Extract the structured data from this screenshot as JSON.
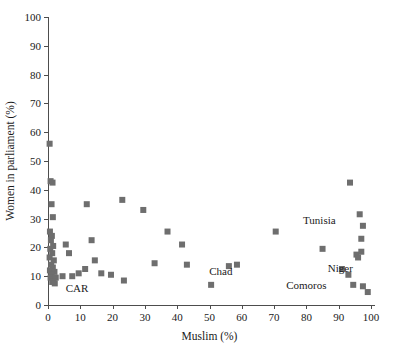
{
  "chart_data": {
    "type": "scatter",
    "title": "",
    "xlabel": "Muslim (%)",
    "ylabel": "Women in parliament (%)",
    "xlim": [
      0,
      100
    ],
    "ylim": [
      0,
      100
    ],
    "xticks": [
      0,
      10,
      20,
      30,
      40,
      50,
      60,
      70,
      80,
      90,
      100
    ],
    "yticks": [
      0,
      10,
      20,
      30,
      40,
      50,
      60,
      70,
      80,
      90,
      100
    ],
    "grid": false,
    "legend": "none",
    "marker": {
      "shape": "square",
      "color": "#6e6e6e",
      "size": 6
    },
    "points": [
      {
        "x": 0.5,
        "y": 56.0
      },
      {
        "x": 0.8,
        "y": 43.0
      },
      {
        "x": 1.4,
        "y": 42.5
      },
      {
        "x": 1.1,
        "y": 35.0
      },
      {
        "x": 1.5,
        "y": 30.5
      },
      {
        "x": 0.6,
        "y": 25.5
      },
      {
        "x": 1.2,
        "y": 24.0
      },
      {
        "x": 0.9,
        "y": 22.5
      },
      {
        "x": 1.6,
        "y": 20.5
      },
      {
        "x": 0.7,
        "y": 19.5
      },
      {
        "x": 1.3,
        "y": 18.0
      },
      {
        "x": 0.5,
        "y": 16.5
      },
      {
        "x": 1.8,
        "y": 15.5
      },
      {
        "x": 1.0,
        "y": 14.0
      },
      {
        "x": 1.5,
        "y": 13.0
      },
      {
        "x": 0.6,
        "y": 12.0
      },
      {
        "x": 2.0,
        "y": 11.5
      },
      {
        "x": 1.1,
        "y": 10.5
      },
      {
        "x": 0.8,
        "y": 9.5
      },
      {
        "x": 1.7,
        "y": 9.0
      },
      {
        "x": 2.4,
        "y": 9.5
      },
      {
        "x": 1.3,
        "y": 8.0
      },
      {
        "x": 2.1,
        "y": 7.5
      },
      {
        "x": 4.5,
        "y": 10.0
      },
      {
        "x": 7.5,
        "y": 10.0
      },
      {
        "x": 6.5,
        "y": 18.0
      },
      {
        "x": 5.5,
        "y": 21.0
      },
      {
        "x": 9.5,
        "y": 11.0
      },
      {
        "x": 12.0,
        "y": 35.0
      },
      {
        "x": 11.5,
        "y": 12.5
      },
      {
        "x": 13.5,
        "y": 22.5
      },
      {
        "x": 14.5,
        "y": 15.5
      },
      {
        "x": 16.5,
        "y": 11.0
      },
      {
        "x": 19.5,
        "y": 10.5
      },
      {
        "x": 23.5,
        "y": 8.5
      },
      {
        "x": 23.0,
        "y": 36.5
      },
      {
        "x": 29.5,
        "y": 33.0
      },
      {
        "x": 33.0,
        "y": 14.5
      },
      {
        "x": 37.0,
        "y": 25.5
      },
      {
        "x": 41.5,
        "y": 21.0
      },
      {
        "x": 43.0,
        "y": 14.0
      },
      {
        "x": 50.5,
        "y": 7.0
      },
      {
        "x": 56.0,
        "y": 13.5
      },
      {
        "x": 58.5,
        "y": 14.0
      },
      {
        "x": 70.5,
        "y": 25.5
      },
      {
        "x": 85.0,
        "y": 19.5
      },
      {
        "x": 93.5,
        "y": 42.5
      },
      {
        "x": 96.5,
        "y": 31.5
      },
      {
        "x": 97.5,
        "y": 27.5
      },
      {
        "x": 97.0,
        "y": 23.0
      },
      {
        "x": 95.5,
        "y": 17.5
      },
      {
        "x": 97.0,
        "y": 18.5
      },
      {
        "x": 96.0,
        "y": 16.5
      },
      {
        "x": 91.0,
        "y": 12.5
      },
      {
        "x": 93.0,
        "y": 10.5
      },
      {
        "x": 94.5,
        "y": 7.0
      },
      {
        "x": 97.5,
        "y": 6.5
      },
      {
        "x": 99.0,
        "y": 4.5
      }
    ],
    "annotations": [
      {
        "text": "CAR",
        "x": 9.0,
        "y": 4.5
      },
      {
        "text": "Chad",
        "x": 53.5,
        "y": 10.5
      },
      {
        "text": "Tunisia",
        "x": 84.0,
        "y": 28.0
      },
      {
        "text": "Niger",
        "x": 90.5,
        "y": 11.5
      },
      {
        "text": "Comoros",
        "x": 80.0,
        "y": 5.5
      }
    ]
  }
}
